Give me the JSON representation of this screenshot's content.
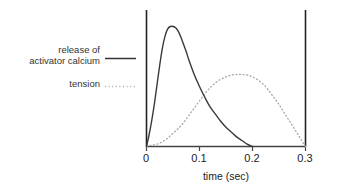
{
  "figure": {
    "name": "muscle-twitch-calcium-tension-plot",
    "background_color": "#ffffff",
    "axis_color": "#222222"
  },
  "legend": {
    "position": "left",
    "entries": [
      {
        "id": "calcium",
        "label_line1": "release of",
        "label_line2": "activator calcium",
        "style": "solid",
        "color": "#333333"
      },
      {
        "id": "tension",
        "label_line1": "tension",
        "label_line2": "",
        "style": "dotted",
        "color": "#999999"
      }
    ]
  },
  "axes": {
    "x_title": "time (sec)",
    "x_ticks": [
      "0",
      "0.1",
      "0.2",
      "0.3"
    ],
    "y_title": "",
    "y_ticks": []
  },
  "chart_data": {
    "type": "line",
    "title": "",
    "subtitle": "",
    "xlabel": "time (sec)",
    "ylabel": "",
    "xlim": [
      0,
      0.3
    ],
    "ylim": [
      0,
      1
    ],
    "grid": false,
    "legend_position": "left",
    "x_ticks": [
      0,
      0.1,
      0.2,
      0.3
    ],
    "x_tick_labels": [
      "0",
      "0.1",
      "0.2",
      "0.3"
    ],
    "series": [
      {
        "name": "release of activator calcium",
        "style": "solid",
        "color": "#333333",
        "peak_x": 0.055,
        "peak_y": 1.0,
        "x": [
          0.0,
          0.005,
          0.01,
          0.015,
          0.02,
          0.025,
          0.03,
          0.035,
          0.04,
          0.045,
          0.05,
          0.055,
          0.06,
          0.065,
          0.07,
          0.075,
          0.08,
          0.09,
          0.1,
          0.11,
          0.12,
          0.13,
          0.14,
          0.15,
          0.16,
          0.17,
          0.18,
          0.19,
          0.2
        ],
        "y": [
          0.0,
          0.1,
          0.22,
          0.36,
          0.52,
          0.68,
          0.82,
          0.92,
          0.98,
          1.0,
          1.0,
          0.99,
          0.96,
          0.91,
          0.85,
          0.79,
          0.72,
          0.6,
          0.5,
          0.41,
          0.33,
          0.27,
          0.21,
          0.16,
          0.12,
          0.08,
          0.05,
          0.02,
          0.0
        ]
      },
      {
        "name": "tension",
        "style": "dotted",
        "color": "#999999",
        "peak_x": 0.19,
        "peak_y": 0.6,
        "x": [
          0.0,
          0.01,
          0.02,
          0.03,
          0.04,
          0.05,
          0.06,
          0.07,
          0.08,
          0.09,
          0.1,
          0.11,
          0.12,
          0.13,
          0.14,
          0.15,
          0.16,
          0.17,
          0.18,
          0.19,
          0.2,
          0.21,
          0.22,
          0.23,
          0.24,
          0.25,
          0.26,
          0.27,
          0.28,
          0.29,
          0.3
        ],
        "y": [
          0.0,
          0.01,
          0.02,
          0.04,
          0.07,
          0.11,
          0.15,
          0.2,
          0.26,
          0.32,
          0.38,
          0.44,
          0.49,
          0.53,
          0.56,
          0.58,
          0.595,
          0.6,
          0.6,
          0.595,
          0.58,
          0.555,
          0.52,
          0.47,
          0.41,
          0.35,
          0.28,
          0.21,
          0.14,
          0.07,
          0.0
        ]
      }
    ]
  }
}
